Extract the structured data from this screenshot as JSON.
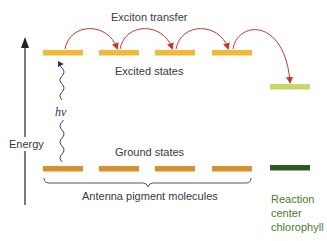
{
  "labels": {
    "exciton_transfer": "Exciton transfer",
    "excited_states": "Excited states",
    "ground_states": "Ground states",
    "energy": "Energy",
    "hv": "hν",
    "antenna": "Antenna pigment molecules",
    "reaction_line1": "Reaction",
    "reaction_line2": "center",
    "reaction_line3": "chlorophyll"
  },
  "colors": {
    "antenna_excited": "#f0b93a",
    "antenna_ground": "#d9902e",
    "rc_excited": "#c8d868",
    "rc_ground": "#2c5a22",
    "arrow": "#c0392b",
    "photon": "#3a3a8a",
    "axis": "#222222",
    "reaction_text": "#4a7a2a"
  }
}
